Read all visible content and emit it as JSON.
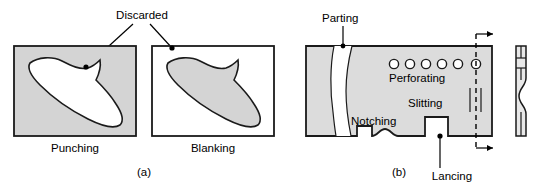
{
  "figure": {
    "colors": {
      "sheet_gray": "#d4d4d4",
      "blank_gray": "#d4d4d4",
      "stock_gray": "#dcdcdc",
      "line_black": "#1a1a1a",
      "background": "#ffffff"
    },
    "panel_a": {
      "caption": "(a)",
      "callout_label": "Discarded",
      "left": {
        "name": "punching",
        "caption": "Punching",
        "description": "Gray sheet with white cut-out blade shape; discarded material is the slug removed from the sheet",
        "sheet_fill": "#d4d4d4",
        "cutout_fill": "#ffffff",
        "rect": {
          "x": 14,
          "y": 46,
          "w": 122,
          "h": 90
        }
      },
      "right": {
        "name": "blanking",
        "caption": "Blanking",
        "description": "White sheet with gray blade-shaped blank; discarded material is the surrounding sheet",
        "sheet_fill": "#ffffff",
        "blank_fill": "#d4d4d4",
        "rect": {
          "x": 152,
          "y": 46,
          "w": 122,
          "h": 90
        }
      }
    },
    "panel_b": {
      "caption": "(b)",
      "strip": {
        "x": 306,
        "y": 46,
        "w": 186,
        "h": 90,
        "fill": "#dcdcdc"
      },
      "labels": [
        {
          "key": "parting",
          "text": "Parting",
          "x": 322,
          "y": 22
        },
        {
          "key": "perforating",
          "text": "Perforating",
          "x": 389,
          "y": 78
        },
        {
          "key": "slitting",
          "text": "Slitting",
          "x": 408,
          "y": 103
        },
        {
          "key": "notching",
          "text": "Notching",
          "x": 351,
          "y": 122
        },
        {
          "key": "lancing",
          "text": "Lancing",
          "x": 429,
          "y": 178
        }
      ],
      "perforating_holes": 6,
      "slitting_lines": 2,
      "notches": 2,
      "feed_arrows": 2,
      "side_view": {
        "x": 514,
        "y": 46,
        "w": 12,
        "h": 90,
        "description": "Edge view of strip showing lanced tab bulge and pierced slots"
      }
    }
  }
}
